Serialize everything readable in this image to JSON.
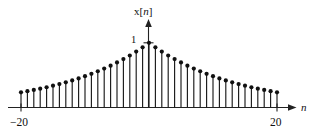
{
  "figure": {
    "title": "",
    "y_axis_label_base": "x[",
    "y_axis_label_var": "n",
    "y_axis_label_close": "]",
    "x_axis_label": "n",
    "y_tick_label": "1",
    "x_tick_left_label": "−20",
    "x_tick_right_label": "20",
    "axis_color": "#222222",
    "stem_color": "#1a1a1a",
    "marker_color": "#111111",
    "background_color": "#ffffff"
  },
  "chart_data": {
    "type": "scatter",
    "plot_style": "stem",
    "title": "",
    "xlabel": "n",
    "ylabel": "x[n]",
    "xlim": [
      -20,
      20
    ],
    "ylim": [
      0,
      1
    ],
    "grid": false,
    "legend": null,
    "xticks": [
      -20,
      20
    ],
    "xticklabels": [
      "−20",
      "20"
    ],
    "yticks": [
      1
    ],
    "yticklabels": [
      "1"
    ],
    "annotations": [],
    "x": [
      -20,
      -19,
      -18,
      -17,
      -16,
      -15,
      -14,
      -13,
      -12,
      -11,
      -10,
      -9,
      -8,
      -7,
      -6,
      -5,
      -4,
      -3,
      -2,
      -1,
      0,
      1,
      2,
      3,
      4,
      5,
      6,
      7,
      8,
      9,
      10,
      11,
      12,
      13,
      14,
      15,
      16,
      17,
      18,
      19,
      20
    ],
    "values": [
      0.234,
      0.252,
      0.271,
      0.291,
      0.313,
      0.337,
      0.362,
      0.389,
      0.419,
      0.45,
      0.484,
      0.521,
      0.56,
      0.602,
      0.647,
      0.696,
      0.748,
      0.804,
      0.865,
      0.93,
      1.0,
      0.93,
      0.865,
      0.804,
      0.748,
      0.696,
      0.647,
      0.602,
      0.56,
      0.521,
      0.484,
      0.45,
      0.419,
      0.389,
      0.362,
      0.337,
      0.313,
      0.291,
      0.271,
      0.252,
      0.234
    ]
  }
}
